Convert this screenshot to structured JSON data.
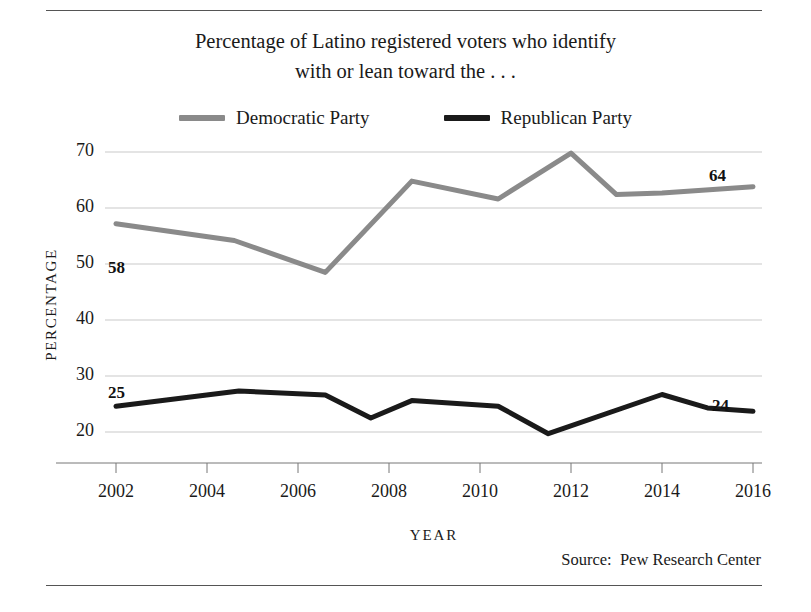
{
  "title": {
    "line1": "Percentage of Latino registered voters who identify",
    "line2": "with or lean toward the . . ."
  },
  "legend": {
    "items": [
      {
        "label": "Democratic Party",
        "color": "#8a8a8a"
      },
      {
        "label": "Republican Party",
        "color": "#1a1a1a"
      }
    ]
  },
  "source": "Source:  Pew Research Center",
  "axis": {
    "x_title": "YEAR",
    "y_title": "PERCENTAGE",
    "y_ticks": [
      "70",
      "60",
      "50",
      "40",
      "30",
      "20"
    ],
    "x_ticks": [
      "2002",
      "2004",
      "2006",
      "2008",
      "2010",
      "2012",
      "2014",
      "2016"
    ]
  },
  "annotations": {
    "dem_start": "58",
    "dem_end": "64",
    "rep_start": "25",
    "rep_end": "24"
  },
  "chart_data": {
    "type": "line",
    "title": "Percentage of Latino registered voters who identify with or lean toward the . . .",
    "xlabel": "YEAR",
    "ylabel": "PERCENTAGE",
    "xlim": [
      2002,
      2016
    ],
    "ylim": [
      17,
      72
    ],
    "y_ticks": [
      20,
      30,
      40,
      50,
      60,
      70
    ],
    "x_ticks": [
      2002,
      2004,
      2006,
      2008,
      2010,
      2012,
      2014,
      2016
    ],
    "grid": "horizontal",
    "legend_position": "top-center",
    "source": "Pew Research Center",
    "series": [
      {
        "name": "Democratic Party",
        "color": "#8a8a8a",
        "start_label": 58,
        "end_label": 64,
        "points": [
          {
            "x": 2002.0,
            "y": 57.2
          },
          {
            "x": 2004.6,
            "y": 54.2
          },
          {
            "x": 2006.6,
            "y": 48.5
          },
          {
            "x": 2008.5,
            "y": 64.8
          },
          {
            "x": 2010.4,
            "y": 61.6
          },
          {
            "x": 2012.0,
            "y": 69.8
          },
          {
            "x": 2013.0,
            "y": 62.4
          },
          {
            "x": 2014.0,
            "y": 62.7
          },
          {
            "x": 2016.0,
            "y": 63.8
          }
        ]
      },
      {
        "name": "Republican Party",
        "color": "#1a1a1a",
        "start_label": 25,
        "end_label": 24,
        "points": [
          {
            "x": 2002.0,
            "y": 24.6
          },
          {
            "x": 2004.7,
            "y": 27.3
          },
          {
            "x": 2006.6,
            "y": 26.6
          },
          {
            "x": 2007.6,
            "y": 22.5
          },
          {
            "x": 2008.5,
            "y": 25.6
          },
          {
            "x": 2010.4,
            "y": 24.6
          },
          {
            "x": 2011.5,
            "y": 19.7
          },
          {
            "x": 2014.0,
            "y": 26.7
          },
          {
            "x": 2015.0,
            "y": 24.3
          },
          {
            "x": 2016.0,
            "y": 23.7
          }
        ]
      }
    ]
  }
}
